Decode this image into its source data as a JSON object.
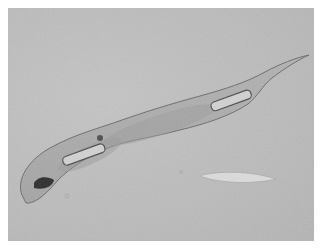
{
  "image": {
    "subject": "nematode micrograph",
    "background_color": "#bcbcbc",
    "border_color": "#ffffff",
    "colors": {
      "body_fill": "#a8a8a8",
      "body_outline": "#6a6a6a",
      "dark_spot": "#2a2a2a",
      "organ_outline": "#4a4a4a",
      "organ_fill": "#d2d2d2",
      "needle": "#dcdcdc"
    }
  }
}
